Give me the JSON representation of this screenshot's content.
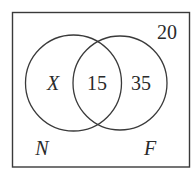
{
  "diagram": {
    "type": "venn",
    "universe": {
      "outside_count": "20"
    },
    "sets": [
      {
        "name": "N",
        "only_value": "X"
      },
      {
        "name": "F",
        "only_value": "35"
      }
    ],
    "intersection": {
      "value": "15"
    },
    "colors": {
      "stroke": "#3a3a3a",
      "text": "#2a2a2a",
      "background": "#ffffff"
    }
  }
}
